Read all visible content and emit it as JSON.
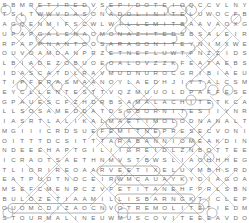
{
  "puzzle": {
    "kind": "word-search",
    "theme": "minerals",
    "rows": 23,
    "cols": 28,
    "letter_color": "#6e6e6e",
    "mark_color": "#9a9a9a",
    "background_color": "#ffffff",
    "grid_rows": [
      "SBMRETIREDVSEPIDOTEIOQCCVLNY",
      "TSLTWWVDASONADOLINITELUWOCFB",
      "AGQENMIFSCWLWILLEMITBAAVAOXG",
      "UPAPGALENAOMONAZITEDSBSALEIR",
      "RPAPPNANTOOSARAGONITEYNIMXWE",
      "OUVOAMDANPRZETNEFLUWTFNZZIDS",
      "LBIADEZOBUOEOALOVZZKFEATAEBS",
      "IDASCATDLRAVMUDNUROCGRIBIAEU",
      "TIPFERASMAANOYLAEDHJIYTALCSM",
      "EYCLLENTESTTVQZMUUOLDPAFFESE",
      "GPAUESCFZHDRBSAMALACHITETKCA",
      "LLSOSAMEDDATDSGBORNITESIIYNR",
      "IASRTLALIKALMAETIMOLODNANALT",
      "MGIIICRDSUEFEMITNEPRESECVONI",
      "OITTTDCSITTTARABANNIOMEAKDIN",
      "NDEEEHAPTGILIIGREIDLZNBOTTEE",
      "ICRAOTSAETHNMVSTBWSLIAOHHHEG",
      "TLIORIREOAARVEETIXELUYMBHSRD",
      "EATPUOTNOCEIRWMCAUAYKYDIAGOA",
      "MSEFCMENRCZVFETITANEHFPRLSBN",
      "BULOZETIAAMILLISBARNGKTICLEP",
      "OUOMCDIZAOCNVOTREMOLITETIEDM",
      "STOURMALINEUWMUSCOVITEEEAVDO"
    ],
    "circled_words": [
      "RETIRED",
      "EPIDOTE",
      "DOLINITE",
      "WILLEMITE",
      "GALENA",
      "MONAZITE",
      "ARAGONITE",
      "CORUNDUM",
      "TALC",
      "MALACHITE",
      "BORNITE",
      "PENTIMITE",
      "ANNABARITE",
      "TITANITE",
      "TREMOLITE",
      "TOURMALINE",
      "MUSCOVITE"
    ]
  }
}
